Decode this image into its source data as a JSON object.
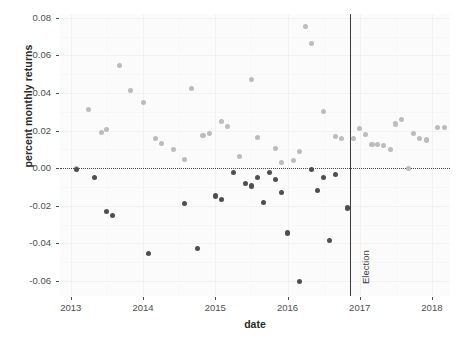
{
  "chart_data": {
    "type": "scatter",
    "title": "",
    "xlabel": "date",
    "ylabel": "percent monthly returns",
    "xlim": [
      2012.85,
      2018.25
    ],
    "ylim": [
      -0.068,
      0.082
    ],
    "grid": true,
    "legend": null,
    "yticks": [
      0.08,
      0.06,
      0.04,
      0.02,
      0.0,
      -0.02,
      -0.04,
      -0.06
    ],
    "yticklabels": [
      "0.08",
      "0.06",
      "0.04",
      "0.02",
      "0.00",
      "-0.02",
      "-0.04",
      "-0.06"
    ],
    "xticks": [
      2013,
      2014,
      2015,
      2016,
      2017,
      2018
    ],
    "xticklabels": [
      "2013",
      "2014",
      "2015",
      "2016",
      "2017",
      "2018"
    ],
    "annotations": [
      {
        "name": "election-line",
        "type": "vline",
        "x": 2016.86,
        "label": "Election"
      },
      {
        "name": "zero-line",
        "type": "hline",
        "y": 0.0,
        "style": "dotted"
      }
    ],
    "series": [
      {
        "name": "positive monthly returns",
        "color": "#bcbcbc",
        "points": [
          {
            "x": 2013.08,
            "y": 0.0
          },
          {
            "x": 2013.25,
            "y": 0.031
          },
          {
            "x": 2013.42,
            "y": 0.0188
          },
          {
            "x": 2013.5,
            "y": 0.0205
          },
          {
            "x": 2013.67,
            "y": 0.0545
          },
          {
            "x": 2013.83,
            "y": 0.0412
          },
          {
            "x": 2014.0,
            "y": 0.0348
          },
          {
            "x": 2014.17,
            "y": 0.016
          },
          {
            "x": 2014.25,
            "y": 0.013
          },
          {
            "x": 2014.42,
            "y": 0.01
          },
          {
            "x": 2014.58,
            "y": 0.0048
          },
          {
            "x": 2014.67,
            "y": 0.0422
          },
          {
            "x": 2014.83,
            "y": 0.0175
          },
          {
            "x": 2014.92,
            "y": 0.0185
          },
          {
            "x": 2015.08,
            "y": 0.0248
          },
          {
            "x": 2015.17,
            "y": 0.0222
          },
          {
            "x": 2015.33,
            "y": 0.0062
          },
          {
            "x": 2015.5,
            "y": 0.0472
          },
          {
            "x": 2015.58,
            "y": 0.0162
          },
          {
            "x": 2015.83,
            "y": 0.0105
          },
          {
            "x": 2015.92,
            "y": 0.003
          },
          {
            "x": 2016.08,
            "y": 0.0042
          },
          {
            "x": 2016.17,
            "y": 0.0088
          },
          {
            "x": 2016.25,
            "y": 0.0752
          },
          {
            "x": 2016.33,
            "y": 0.0662
          },
          {
            "x": 2016.5,
            "y": 0.03
          },
          {
            "x": 2016.67,
            "y": 0.0168
          },
          {
            "x": 2016.75,
            "y": 0.0158
          },
          {
            "x": 2016.92,
            "y": 0.0158
          },
          {
            "x": 2017.0,
            "y": 0.0212
          },
          {
            "x": 2017.08,
            "y": 0.018
          },
          {
            "x": 2017.17,
            "y": 0.0128
          },
          {
            "x": 2017.25,
            "y": 0.0125
          },
          {
            "x": 2017.33,
            "y": 0.0122
          },
          {
            "x": 2017.42,
            "y": 0.0098
          },
          {
            "x": 2017.5,
            "y": 0.0235
          },
          {
            "x": 2017.58,
            "y": 0.0258
          },
          {
            "x": 2017.67,
            "y": 0.0
          },
          {
            "x": 2017.75,
            "y": 0.0182
          },
          {
            "x": 2017.83,
            "y": 0.0158
          },
          {
            "x": 2017.92,
            "y": 0.015
          },
          {
            "x": 2018.08,
            "y": 0.0218
          },
          {
            "x": 2018.17,
            "y": 0.0215
          }
        ]
      },
      {
        "name": "negative monthly returns",
        "color": "#4f4f4f",
        "points": [
          {
            "x": 2013.08,
            "y": -0.0008
          },
          {
            "x": 2013.33,
            "y": -0.0052
          },
          {
            "x": 2013.5,
            "y": -0.0232
          },
          {
            "x": 2013.58,
            "y": -0.0252
          },
          {
            "x": 2014.08,
            "y": -0.0452
          },
          {
            "x": 2014.58,
            "y": -0.0188
          },
          {
            "x": 2014.75,
            "y": -0.0428
          },
          {
            "x": 2015.0,
            "y": -0.0148
          },
          {
            "x": 2015.08,
            "y": -0.0165
          },
          {
            "x": 2015.25,
            "y": -0.0022
          },
          {
            "x": 2015.42,
            "y": -0.008
          },
          {
            "x": 2015.5,
            "y": -0.0095
          },
          {
            "x": 2015.58,
            "y": -0.005
          },
          {
            "x": 2015.67,
            "y": -0.0185
          },
          {
            "x": 2015.75,
            "y": -0.0025
          },
          {
            "x": 2015.83,
            "y": -0.0062
          },
          {
            "x": 2015.92,
            "y": -0.013
          },
          {
            "x": 2016.0,
            "y": -0.0345
          },
          {
            "x": 2016.17,
            "y": -0.0605
          },
          {
            "x": 2016.33,
            "y": -0.0005
          },
          {
            "x": 2016.42,
            "y": -0.0118
          },
          {
            "x": 2016.5,
            "y": -0.0048
          },
          {
            "x": 2016.58,
            "y": -0.0385
          },
          {
            "x": 2016.67,
            "y": -0.0032
          },
          {
            "x": 2016.83,
            "y": -0.0212
          }
        ]
      }
    ]
  }
}
